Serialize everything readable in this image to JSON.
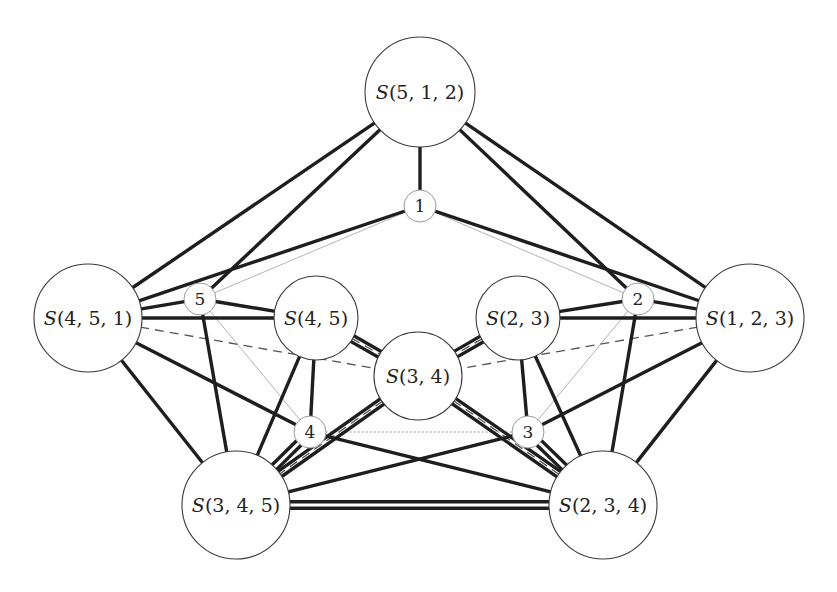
{
  "diagram": {
    "type": "graph",
    "nodes": [
      {
        "id": "S512",
        "label": "S(5,1,2)",
        "size": "large",
        "x": 420,
        "y": 92,
        "r": 55
      },
      {
        "id": "S451",
        "label": "S(4,5,1)",
        "size": "large",
        "x": 88,
        "y": 318,
        "r": 54
      },
      {
        "id": "S123",
        "label": "S(1,2,3)",
        "size": "large",
        "x": 750,
        "y": 318,
        "r": 54
      },
      {
        "id": "S345",
        "label": "S(3,4,5)",
        "size": "large",
        "x": 236,
        "y": 505,
        "r": 54
      },
      {
        "id": "S234",
        "label": "S(2,3,4)",
        "size": "large",
        "x": 603,
        "y": 505,
        "r": 54
      },
      {
        "id": "S45",
        "label": "S(4,5)",
        "size": "medium",
        "x": 316,
        "y": 318,
        "r": 42
      },
      {
        "id": "S23",
        "label": "S(2,3)",
        "size": "medium",
        "x": 518,
        "y": 318,
        "r": 42
      },
      {
        "id": "S34",
        "label": "S(3,4)",
        "size": "medium",
        "x": 418,
        "y": 376,
        "r": 44
      },
      {
        "id": "n1",
        "label": "1",
        "size": "small",
        "x": 420,
        "y": 206,
        "r": 16
      },
      {
        "id": "n2",
        "label": "2",
        "size": "small",
        "x": 638,
        "y": 299,
        "r": 16
      },
      {
        "id": "n3",
        "label": "3",
        "size": "small",
        "x": 528,
        "y": 432,
        "r": 16
      },
      {
        "id": "n4",
        "label": "4",
        "size": "small",
        "x": 310,
        "y": 432,
        "r": 16
      },
      {
        "id": "n5",
        "label": "5",
        "size": "small",
        "x": 200,
        "y": 299,
        "r": 16
      }
    ],
    "edges": {
      "thick": [
        [
          "S512",
          "n1"
        ],
        [
          "S512",
          "S451"
        ],
        [
          "S512",
          "n5"
        ],
        [
          "S512",
          "S123"
        ],
        [
          "S512",
          "n2"
        ],
        [
          "n1",
          "S451"
        ],
        [
          "n1",
          "S123"
        ],
        [
          "S451",
          "n5"
        ],
        [
          "S451",
          "S45"
        ],
        [
          "S451",
          "n4"
        ],
        [
          "S451",
          "S345"
        ],
        [
          "n5",
          "S45"
        ],
        [
          "n5",
          "S345"
        ],
        [
          "S45",
          "n4"
        ],
        [
          "S45",
          "S345"
        ],
        [
          "S123",
          "n2"
        ],
        [
          "S123",
          "S23"
        ],
        [
          "S123",
          "n3"
        ],
        [
          "S123",
          "S234"
        ],
        [
          "n2",
          "S23"
        ],
        [
          "n2",
          "S234"
        ],
        [
          "S23",
          "n3"
        ],
        [
          "S23",
          "S234"
        ],
        [
          "n4",
          "S234"
        ],
        [
          "n3",
          "S345"
        ]
      ],
      "double": [
        [
          "S45",
          "S34"
        ],
        [
          "S23",
          "S34"
        ],
        [
          "S34",
          "S345"
        ],
        [
          "S34",
          "S234"
        ],
        [
          "n4",
          "S345"
        ],
        [
          "n3",
          "S234"
        ],
        [
          "S345",
          "S234"
        ]
      ],
      "thin": [
        [
          "n5",
          "n1"
        ],
        [
          "n1",
          "n2"
        ],
        [
          "n5",
          "n4"
        ],
        [
          "n2",
          "n3"
        ]
      ],
      "dotted": [
        [
          "n4",
          "n3"
        ]
      ],
      "dashed": [
        [
          "S451",
          "S34"
        ],
        [
          "S123",
          "S34"
        ],
        [
          "S34",
          "S345"
        ],
        [
          "S34",
          "S234"
        ],
        [
          "S45",
          "S34"
        ],
        [
          "S23",
          "S34"
        ]
      ]
    },
    "colors": {
      "edge_thick": "#1e1e1e",
      "edge_thin": "#b4b4b4",
      "edge_dashed": "#555555",
      "node_stroke": "#3a3a3a",
      "background": "#ffffff"
    }
  }
}
